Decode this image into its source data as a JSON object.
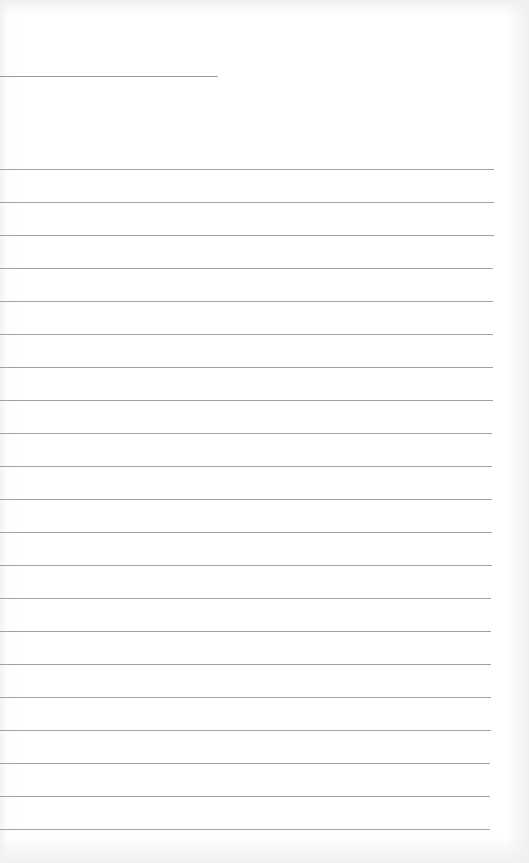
{
  "document": {
    "type": "ruled-paper",
    "header_line_present": true,
    "ruled_line_count": 21,
    "text_content": "",
    "colors": {
      "paper": "#ffffff",
      "rule": "#a2a2a2",
      "edge_shadow": "#f0f0f0"
    }
  }
}
